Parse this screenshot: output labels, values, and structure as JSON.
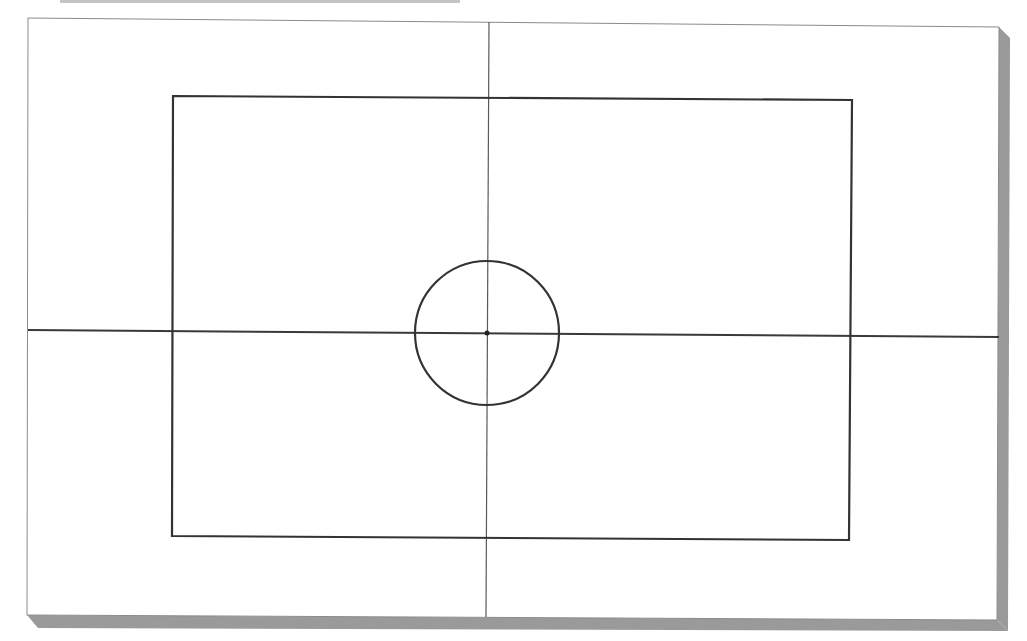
{
  "diagram": {
    "width": 1027,
    "height": 641,
    "colors": {
      "background": "#ffffff",
      "frame_stroke": "#8a8a8a",
      "shadow": "#9a9a9a",
      "axis_stroke": "#5a5a5a",
      "horizontal_axis_stroke": "#3a3a3a",
      "shape_stroke": "#333333",
      "top_band": "#c4c4c4"
    },
    "frame": {
      "points": "28,18 999,27 997,620 27,615",
      "shadow_right": "999,27 1010,38 1008,631 997,620",
      "shadow_bottom": "27,615 997,620 1008,631 38,628"
    },
    "horizontal_axis": {
      "x1": 28,
      "y1": 330,
      "x2": 999,
      "y2": 337
    },
    "vertical_axis": {
      "x1": 489,
      "y1": 22,
      "x2": 486,
      "y2": 617
    },
    "rectangle": {
      "points": "173,96 852,100 849,540 172,536"
    },
    "circle": {
      "cx": 487,
      "cy": 333,
      "r": 72
    },
    "center_point": {
      "cx": 487,
      "cy": 333,
      "r": 2.5
    }
  }
}
